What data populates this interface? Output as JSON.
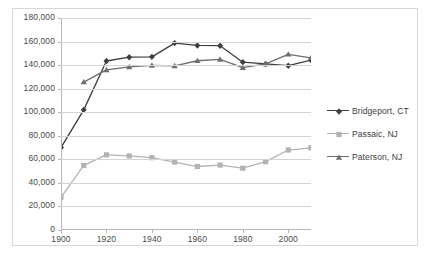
{
  "chart_data": {
    "type": "line",
    "title": "",
    "xlabel": "",
    "ylabel": "",
    "x": [
      1900,
      1910,
      1920,
      1930,
      1940,
      1950,
      1960,
      1970,
      1980,
      1990,
      2000,
      2010
    ],
    "xlim": [
      1900,
      2010
    ],
    "ylim": [
      0,
      180000
    ],
    "ytick_labels": [
      "180,000",
      "160,000",
      "140,000",
      "120,000",
      "100,000",
      "80,000",
      "60,000",
      "40,000",
      "20,000",
      "0"
    ],
    "ytick_values": [
      180000,
      160000,
      140000,
      120000,
      100000,
      80000,
      60000,
      40000,
      20000,
      0
    ],
    "xtick_labels": [
      "1900",
      "1920",
      "1940",
      "1960",
      "1980",
      "2000"
    ],
    "xtick_values": [
      1900,
      1920,
      1940,
      1960,
      1980,
      2000
    ],
    "grid": true,
    "legend_position": "right",
    "series": [
      {
        "name": "Bridgeport, CT",
        "color": "#3f3f3f",
        "marker": "diamond",
        "x": [
          1900,
          1910,
          1920,
          1930,
          1940,
          1950,
          1960,
          1970,
          1980,
          1990,
          2000,
          2010
        ],
        "values": [
          70000,
          102000,
          143500,
          146700,
          147000,
          158700,
          156700,
          156500,
          142500,
          141000,
          139500,
          144200
        ]
      },
      {
        "name": "Passaic, NJ",
        "color": "#b3b3b3",
        "marker": "square",
        "x": [
          1900,
          1910,
          1920,
          1930,
          1940,
          1950,
          1960,
          1970,
          1980,
          1990,
          2000,
          2010
        ],
        "values": [
          27800,
          54800,
          63800,
          62900,
          61400,
          57700,
          53900,
          55100,
          52500,
          58000,
          67900,
          69800
        ]
      },
      {
        "name": "Paterson, NJ",
        "color": "#6e6e6e",
        "marker": "triangle",
        "x": [
          1910,
          1920,
          1930,
          1940,
          1950,
          1960,
          1970,
          1980,
          1990,
          2000,
          2010
        ],
        "values": [
          125600,
          135900,
          138500,
          139700,
          139300,
          143700,
          144800,
          137900,
          141000,
          149200,
          146200
        ]
      }
    ]
  },
  "legend": {
    "items": [
      {
        "label": "Bridgeport, CT"
      },
      {
        "label": "Passaic, NJ"
      },
      {
        "label": "Paterson, NJ"
      }
    ]
  },
  "colors": {
    "bridgeport": "#3f3f3f",
    "passaic": "#b3b3b3",
    "paterson": "#6e6e6e",
    "gridline": "#d4d4d4",
    "axis": "#b7b7b7",
    "text": "#4a4a4a",
    "frame": "#d9d9d9"
  }
}
